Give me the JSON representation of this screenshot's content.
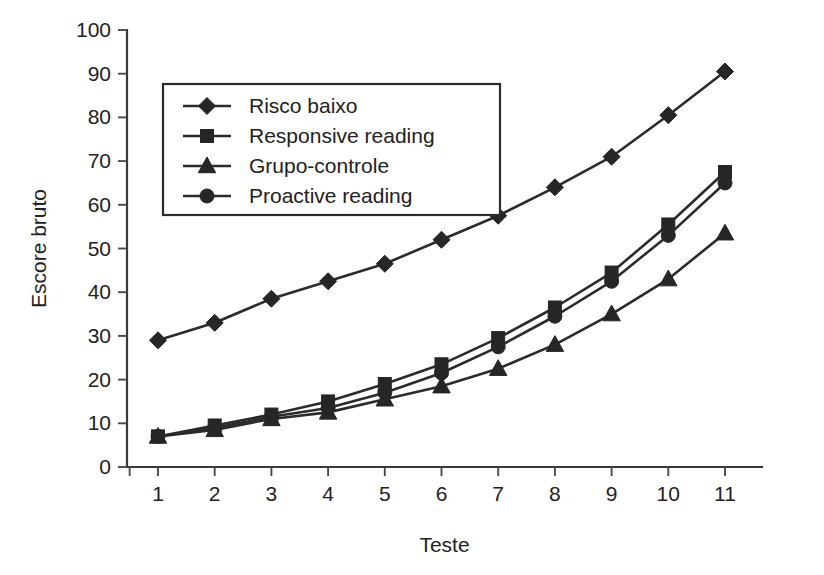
{
  "chart_data": {
    "type": "line",
    "title": "",
    "xlabel": "Teste",
    "ylabel": "Escore bruto",
    "categories": [
      "1",
      "2",
      "3",
      "4",
      "5",
      "6",
      "7",
      "8",
      "9",
      "10",
      "11"
    ],
    "x": [
      1,
      2,
      3,
      4,
      5,
      6,
      7,
      8,
      9,
      10,
      11
    ],
    "xlim": [
      0.5,
      11.5
    ],
    "ylim": [
      0,
      100
    ],
    "y_ticks": [
      0,
      10,
      20,
      30,
      40,
      50,
      60,
      70,
      80,
      90,
      100
    ],
    "x_ticks": [
      "1",
      "2",
      "3",
      "4",
      "5",
      "6",
      "7",
      "8",
      "9",
      "10",
      "11"
    ],
    "grid": false,
    "legend_position": "upper-left-inside",
    "series": [
      {
        "name": "Risco baixo",
        "marker": "diamond",
        "color": "#262626",
        "values": [
          29,
          33,
          38.5,
          42.5,
          46.5,
          52,
          57.5,
          64,
          71,
          80.5,
          90.5
        ]
      },
      {
        "name": "Responsive reading",
        "marker": "square",
        "color": "#262626",
        "values": [
          7,
          9.5,
          12,
          15,
          19,
          23.5,
          29.5,
          36.5,
          44.5,
          55.5,
          67.5
        ]
      },
      {
        "name": "Grupo-controle",
        "marker": "triangle",
        "color": "#262626",
        "values": [
          7,
          8.5,
          11,
          12.5,
          15.5,
          18.5,
          22.5,
          28,
          35,
          43,
          53.5
        ]
      },
      {
        "name": "Proactive reading",
        "marker": "circle",
        "color": "#262626",
        "values": [
          7,
          9,
          11.5,
          13.5,
          17,
          21.5,
          27.5,
          34.5,
          42.5,
          53,
          65
        ]
      }
    ]
  },
  "legend": {
    "entries": [
      {
        "label": "Risco baixo",
        "marker": "diamond"
      },
      {
        "label": "Responsive reading",
        "marker": "square"
      },
      {
        "label": "Grupo-controle",
        "marker": "triangle"
      },
      {
        "label": "Proactive reading",
        "marker": "circle"
      }
    ]
  },
  "axes": {
    "y_title": "Escore bruto",
    "x_title": "Teste"
  }
}
